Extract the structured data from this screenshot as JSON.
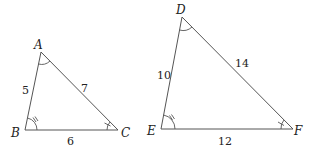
{
  "figure": {
    "triangles": [
      {
        "name": "ABC",
        "vertices": [
          {
            "label": "A",
            "x": 41,
            "y": 52
          },
          {
            "label": "B",
            "x": 25,
            "y": 130
          },
          {
            "label": "C",
            "x": 118,
            "y": 130
          }
        ],
        "sides": [
          {
            "between": "AB",
            "length": "5"
          },
          {
            "between": "AC",
            "length": "7"
          },
          {
            "between": "BC",
            "length": "6"
          }
        ],
        "angle_marks": {
          "A": "single-arc",
          "B": "arc-double-tick",
          "C": "arc-single-tick"
        }
      },
      {
        "name": "DEF",
        "vertices": [
          {
            "label": "D",
            "x": 182,
            "y": 17
          },
          {
            "label": "E",
            "x": 161,
            "y": 129
          },
          {
            "label": "F",
            "x": 293,
            "y": 129
          }
        ],
        "sides": [
          {
            "between": "DE",
            "length": "10"
          },
          {
            "between": "DF",
            "length": "14"
          },
          {
            "between": "EF",
            "length": "12"
          }
        ],
        "angle_marks": {
          "D": "single-arc",
          "E": "arc-double-tick",
          "F": "arc-single-tick"
        }
      }
    ]
  }
}
